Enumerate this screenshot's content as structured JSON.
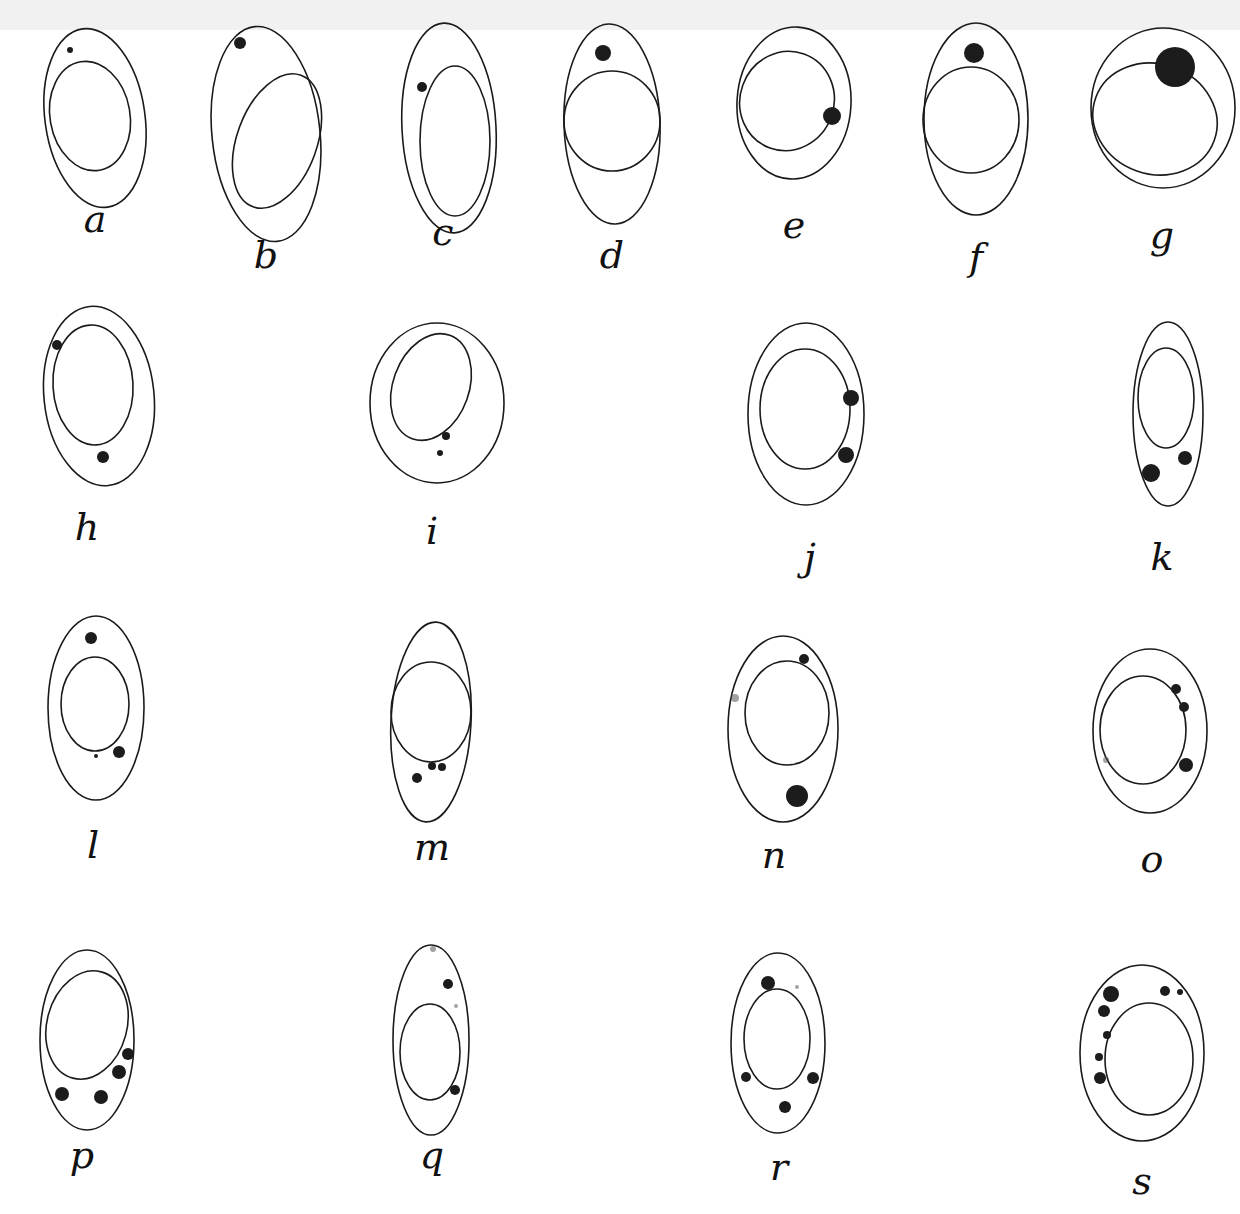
{
  "plate": {
    "width": 1240,
    "height": 1214,
    "description": "Plate of 19 drawn cells, each with an outer cell membrane, a nucleus and dark stained granules",
    "colors": {
      "ink": "#1a1a1a",
      "paper": "#ffffff"
    }
  },
  "figures": [
    {
      "label": "a",
      "lx": 95,
      "ly": 232,
      "cell": {
        "cx": 95,
        "cy": 118,
        "rx": 50,
        "ry": 90,
        "rot": -8
      },
      "nucleus": {
        "cx": 90,
        "cy": 116,
        "rx": 40,
        "ry": 55,
        "rot": -10
      },
      "granules": [
        {
          "x": 70,
          "y": 50,
          "r": 3
        }
      ]
    },
    {
      "label": "b",
      "lx": 266,
      "ly": 268,
      "cell": {
        "cx": 266,
        "cy": 134,
        "rx": 54,
        "ry": 108,
        "rot": -6
      },
      "nucleus": {
        "cx": 277,
        "cy": 141,
        "rx": 40,
        "ry": 70,
        "rot": 20
      },
      "granules": [
        {
          "x": 240,
          "y": 43,
          "r": 6
        }
      ]
    },
    {
      "label": "c",
      "lx": 443,
      "ly": 245,
      "cell": {
        "cx": 449,
        "cy": 128,
        "rx": 47,
        "ry": 105,
        "rot": -3
      },
      "nucleus": {
        "cx": 455,
        "cy": 141,
        "rx": 35,
        "ry": 75,
        "rot": 0
      },
      "granules": [
        {
          "x": 422,
          "y": 87,
          "r": 5
        }
      ]
    },
    {
      "label": "d",
      "lx": 612,
      "ly": 268,
      "cell": {
        "cx": 612,
        "cy": 124,
        "rx": 48,
        "ry": 100,
        "rot": -2
      },
      "nucleus": {
        "cx": 612,
        "cy": 121,
        "rx": 48,
        "ry": 50,
        "rot": 0
      },
      "granules": [
        {
          "x": 603,
          "y": 53,
          "r": 8
        }
      ]
    },
    {
      "label": "e",
      "lx": 794,
      "ly": 238,
      "cell": {
        "cx": 794,
        "cy": 103,
        "rx": 57,
        "ry": 76,
        "rot": 3
      },
      "nucleus": {
        "cx": 787,
        "cy": 101,
        "rx": 47,
        "ry": 50,
        "rot": 20
      },
      "granules": [
        {
          "x": 832,
          "y": 116,
          "r": 9
        }
      ]
    },
    {
      "label": "f",
      "lx": 976,
      "ly": 270,
      "cell": {
        "cx": 976,
        "cy": 119,
        "rx": 52,
        "ry": 96,
        "rot": 0
      },
      "nucleus": {
        "cx": 971,
        "cy": 120,
        "rx": 48,
        "ry": 53,
        "rot": 0
      },
      "granules": [
        {
          "x": 974,
          "y": 53,
          "r": 10
        }
      ]
    },
    {
      "label": "g",
      "lx": 1162,
      "ly": 248,
      "cell": {
        "cx": 1163,
        "cy": 108,
        "rx": 72,
        "ry": 80,
        "rot": 0
      },
      "nucleus": {
        "cx": 1155,
        "cy": 119,
        "rx": 63,
        "ry": 55,
        "rot": 20
      },
      "granules": [
        {
          "x": 1175,
          "y": 67,
          "r": 20
        }
      ]
    },
    {
      "label": "h",
      "lx": 87,
      "ly": 540,
      "cell": {
        "cx": 99,
        "cy": 396,
        "rx": 55,
        "ry": 90,
        "rot": -6
      },
      "nucleus": {
        "cx": 93,
        "cy": 385,
        "rx": 40,
        "ry": 60,
        "rot": -3
      },
      "granules": [
        {
          "x": 57,
          "y": 345,
          "r": 5
        },
        {
          "x": 103,
          "y": 457,
          "r": 6
        }
      ]
    },
    {
      "label": "i",
      "lx": 432,
      "ly": 544,
      "cell": {
        "cx": 437,
        "cy": 403,
        "rx": 67,
        "ry": 80,
        "rot": 0
      },
      "nucleus": {
        "cx": 431,
        "cy": 387,
        "rx": 38,
        "ry": 55,
        "rot": 20
      },
      "granules": [
        {
          "x": 446,
          "y": 436,
          "r": 4
        },
        {
          "x": 440,
          "y": 453,
          "r": 3
        }
      ]
    },
    {
      "label": "j",
      "lx": 810,
      "ly": 570,
      "cell": {
        "cx": 806,
        "cy": 414,
        "rx": 58,
        "ry": 91,
        "rot": 0
      },
      "nucleus": {
        "cx": 805,
        "cy": 409,
        "rx": 45,
        "ry": 60,
        "rot": 0
      },
      "granules": [
        {
          "x": 851,
          "y": 398,
          "r": 8
        },
        {
          "x": 846,
          "y": 455,
          "r": 8
        }
      ]
    },
    {
      "label": "k",
      "lx": 1162,
      "ly": 570,
      "cell": {
        "cx": 1168,
        "cy": 414,
        "rx": 35,
        "ry": 92,
        "rot": 0
      },
      "nucleus": {
        "cx": 1166,
        "cy": 398,
        "rx": 28,
        "ry": 50,
        "rot": 0
      },
      "granules": [
        {
          "x": 1151,
          "y": 473,
          "r": 9
        },
        {
          "x": 1185,
          "y": 458,
          "r": 7
        }
      ]
    },
    {
      "label": "l",
      "lx": 93,
      "ly": 858,
      "cell": {
        "cx": 96,
        "cy": 708,
        "rx": 48,
        "ry": 92,
        "rot": 0
      },
      "nucleus": {
        "cx": 95,
        "cy": 704,
        "rx": 34,
        "ry": 47,
        "rot": 0
      },
      "granules": [
        {
          "x": 91,
          "y": 638,
          "r": 6
        },
        {
          "x": 96,
          "y": 756,
          "r": 2
        },
        {
          "x": 119,
          "y": 752,
          "r": 6
        }
      ]
    },
    {
      "label": "m",
      "lx": 432,
      "ly": 860,
      "cell": {
        "cx": 431,
        "cy": 722,
        "rx": 40,
        "ry": 100,
        "rot": 3
      },
      "nucleus": {
        "cx": 431,
        "cy": 712,
        "rx": 40,
        "ry": 50,
        "rot": 0
      },
      "granules": [
        {
          "x": 417,
          "y": 778,
          "r": 5
        },
        {
          "x": 432,
          "y": 766,
          "r": 4
        },
        {
          "x": 442,
          "y": 767,
          "r": 4
        }
      ]
    },
    {
      "label": "n",
      "lx": 774,
      "ly": 868,
      "cell": {
        "cx": 783,
        "cy": 729,
        "rx": 55,
        "ry": 93,
        "rot": 0
      },
      "nucleus": {
        "cx": 787,
        "cy": 713,
        "rx": 42,
        "ry": 52,
        "rot": 0
      },
      "granules": [
        {
          "x": 804,
          "y": 659,
          "r": 5
        },
        {
          "x": 735,
          "y": 698,
          "r": 4,
          "light": true
        },
        {
          "x": 797,
          "y": 796,
          "r": 11
        }
      ]
    },
    {
      "label": "o",
      "lx": 1152,
      "ly": 872,
      "cell": {
        "cx": 1150,
        "cy": 731,
        "rx": 57,
        "ry": 82,
        "rot": 0
      },
      "nucleus": {
        "cx": 1143,
        "cy": 730,
        "rx": 43,
        "ry": 54,
        "rot": 0
      },
      "granules": [
        {
          "x": 1176,
          "y": 689,
          "r": 5
        },
        {
          "x": 1184,
          "y": 707,
          "r": 5
        },
        {
          "x": 1186,
          "y": 765,
          "r": 7
        },
        {
          "x": 1106,
          "y": 760,
          "r": 3,
          "light": true
        }
      ]
    },
    {
      "label": "p",
      "lx": 82,
      "ly": 1168,
      "cell": {
        "cx": 87,
        "cy": 1040,
        "rx": 47,
        "ry": 90,
        "rot": 0
      },
      "nucleus": {
        "cx": 87,
        "cy": 1025,
        "rx": 40,
        "ry": 55,
        "rot": 15
      },
      "granules": [
        {
          "x": 128,
          "y": 1054,
          "r": 6
        },
        {
          "x": 119,
          "y": 1072,
          "r": 7
        },
        {
          "x": 62,
          "y": 1094,
          "r": 7
        },
        {
          "x": 101,
          "y": 1097,
          "r": 7
        }
      ]
    },
    {
      "label": "q",
      "lx": 432,
      "ly": 1168,
      "cell": {
        "cx": 431,
        "cy": 1040,
        "rx": 38,
        "ry": 95,
        "rot": 0
      },
      "nucleus": {
        "cx": 430,
        "cy": 1052,
        "rx": 30,
        "ry": 48,
        "rot": 0
      },
      "granules": [
        {
          "x": 433,
          "y": 949,
          "r": 3,
          "light": true
        },
        {
          "x": 448,
          "y": 984,
          "r": 5
        },
        {
          "x": 456,
          "y": 1006,
          "r": 2,
          "light": true
        },
        {
          "x": 455,
          "y": 1090,
          "r": 5
        }
      ]
    },
    {
      "label": "r",
      "lx": 779,
      "ly": 1180,
      "cell": {
        "cx": 778,
        "cy": 1043,
        "rx": 47,
        "ry": 90,
        "rot": 0
      },
      "nucleus": {
        "cx": 777,
        "cy": 1039,
        "rx": 33,
        "ry": 50,
        "rot": 0
      },
      "granules": [
        {
          "x": 768,
          "y": 983,
          "r": 7
        },
        {
          "x": 797,
          "y": 987,
          "r": 2,
          "light": true
        },
        {
          "x": 746,
          "y": 1077,
          "r": 5
        },
        {
          "x": 813,
          "y": 1078,
          "r": 6
        },
        {
          "x": 785,
          "y": 1107,
          "r": 6
        }
      ]
    },
    {
      "label": "s",
      "lx": 1142,
      "ly": 1194,
      "cell": {
        "cx": 1142,
        "cy": 1053,
        "rx": 62,
        "ry": 88,
        "rot": 0
      },
      "nucleus": {
        "cx": 1149,
        "cy": 1059,
        "rx": 44,
        "ry": 56,
        "rot": 0
      },
      "granules": [
        {
          "x": 1111,
          "y": 994,
          "r": 8
        },
        {
          "x": 1104,
          "y": 1011,
          "r": 6
        },
        {
          "x": 1165,
          "y": 991,
          "r": 5
        },
        {
          "x": 1180,
          "y": 992,
          "r": 3
        },
        {
          "x": 1107,
          "y": 1035,
          "r": 4
        },
        {
          "x": 1099,
          "y": 1057,
          "r": 4
        },
        {
          "x": 1100,
          "y": 1078,
          "r": 6
        }
      ]
    }
  ]
}
